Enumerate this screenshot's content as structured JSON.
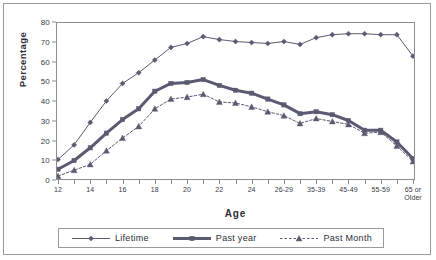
{
  "chart_data": {
    "type": "line",
    "title": "",
    "xlabel": "Age",
    "ylabel": "Percentage",
    "ylim": [
      0,
      80
    ],
    "ytick_step": 10,
    "yticks": [
      0,
      10,
      20,
      30,
      40,
      50,
      60,
      70,
      80
    ],
    "grid": false,
    "legend_position": "bottom",
    "categories": [
      "12",
      "13",
      "14",
      "15",
      "16",
      "17",
      "18",
      "19",
      "20",
      "21",
      "22",
      "23",
      "24",
      "25",
      "26-29",
      "30-34",
      "35-39",
      "40-44",
      "45-49",
      "50-54",
      "55-59",
      "60-64",
      "65 or\nOlder"
    ],
    "tick_labels_shown": [
      "12",
      "",
      "14",
      "",
      "16",
      "",
      "18",
      "",
      "20",
      "",
      "22",
      "",
      "24",
      "",
      "26-29",
      "",
      "35-39",
      "",
      "45-49",
      "",
      "55-59",
      "",
      "65 or\nOlder"
    ],
    "series": [
      {
        "name": "Lifetime",
        "marker": "diamond",
        "line_style": "solid",
        "line_width": 1,
        "color": "#5a5a72",
        "values": [
          10,
          17.5,
          29,
          40,
          49,
          54.5,
          61,
          67.5,
          69.5,
          73,
          71.5,
          70.5,
          70,
          69.5,
          70.5,
          69,
          72.5,
          74,
          74.5,
          74.5,
          74,
          74,
          63
        ]
      },
      {
        "name": "Past year",
        "marker": "square",
        "line_style": "solid",
        "line_width": 3,
        "color": "#5a5a72",
        "values": [
          5,
          9.5,
          16,
          23.5,
          30.5,
          36,
          45,
          49,
          49.5,
          51,
          48,
          45.5,
          44,
          41,
          38,
          33.5,
          34.5,
          33,
          30,
          25,
          25,
          19,
          10.5
        ]
      },
      {
        "name": "Past Month",
        "marker": "triangle",
        "line_style": "dotted",
        "line_width": 1,
        "color": "#5a5a72",
        "values": [
          1.5,
          4.5,
          7.5,
          14.5,
          21,
          27,
          36,
          41,
          42,
          43.5,
          39.5,
          39,
          37,
          34.5,
          32.5,
          28.5,
          31,
          29.5,
          28,
          23.5,
          24,
          17,
          9
        ]
      }
    ]
  },
  "legend": {
    "items": [
      {
        "label": "Lifetime"
      },
      {
        "label": "Past year"
      },
      {
        "label": "Past Month"
      }
    ]
  },
  "colors": {
    "series": "#5a5a72",
    "axis": "#8b8b94",
    "text": "#2e2e38",
    "frame": "#9a9a9a",
    "background": "#ffffff"
  }
}
